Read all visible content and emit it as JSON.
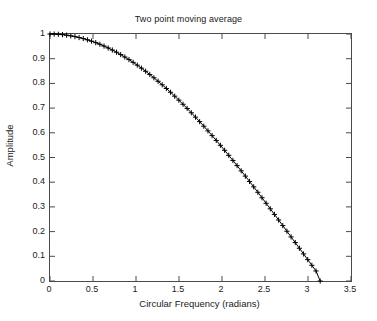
{
  "chart_data": {
    "type": "line",
    "title": "Two point moving average",
    "xlabel": "Circular Frequency  (radians)",
    "ylabel": "Amplitude",
    "xlim": [
      0,
      3.5
    ],
    "ylim": [
      0,
      1
    ],
    "grid": false,
    "legend": null,
    "marker": "plus",
    "line_color": "#000000",
    "marker_color": "#000000",
    "frame_color": "#4a4a4a",
    "background": "#ffffff",
    "xticks": [
      0,
      0.5,
      1,
      1.5,
      2,
      2.5,
      3,
      3.5
    ],
    "xtick_labels": [
      "0",
      "0.5",
      "1",
      "1.5",
      "2",
      "2.5",
      "3",
      "3.5"
    ],
    "yticks": [
      0,
      0.1,
      0.2,
      0.3,
      0.4,
      0.5,
      0.6,
      0.7,
      0.8,
      0.9,
      1
    ],
    "ytick_labels": [
      "0",
      "0.1",
      "0.2",
      "0.3",
      "0.4",
      "0.5",
      "0.6",
      "0.7",
      "0.8",
      "0.9",
      "1"
    ],
    "series": [
      {
        "name": "Two point moving average magnitude response",
        "formula": "|cos(w/2)|",
        "x": [
          0,
          0.0483,
          0.0967,
          0.145,
          0.1933,
          0.2417,
          0.29,
          0.3383,
          0.3867,
          0.435,
          0.4833,
          0.5317,
          0.58,
          0.6283,
          0.6767,
          0.725,
          0.7733,
          0.8217,
          0.87,
          0.9183,
          0.9667,
          1.015,
          1.0633,
          1.1117,
          1.16,
          1.2083,
          1.2567,
          1.305,
          1.3533,
          1.4017,
          1.45,
          1.4983,
          1.5467,
          1.595,
          1.6433,
          1.6917,
          1.74,
          1.7883,
          1.8367,
          1.885,
          1.9333,
          1.9817,
          2.03,
          2.0783,
          2.1267,
          2.175,
          2.2233,
          2.2717,
          2.32,
          2.3683,
          2.4167,
          2.465,
          2.5133,
          2.5617,
          2.61,
          2.6583,
          2.7067,
          2.755,
          2.8033,
          2.8517,
          2.9,
          2.9483,
          2.9967,
          3.045,
          3.0933,
          3.1416
        ],
        "y": [
          1.0,
          0.9997,
          0.9988,
          0.9974,
          0.9953,
          0.9927,
          0.9895,
          0.9857,
          0.9814,
          0.9765,
          0.971,
          0.965,
          0.9584,
          0.9511,
          0.9434,
          0.935,
          0.9262,
          0.9167,
          0.9068,
          0.8963,
          0.8853,
          0.8738,
          0.8617,
          0.8492,
          0.8362,
          0.8227,
          0.8087,
          0.7943,
          0.7794,
          0.7641,
          0.7483,
          0.7321,
          0.7155,
          0.6985,
          0.6811,
          0.6633,
          0.6452,
          0.6267,
          0.6078,
          0.5886,
          0.5691,
          0.5493,
          0.5292,
          0.5088,
          0.4881,
          0.4672,
          0.446,
          0.4246,
          0.403,
          0.3812,
          0.3592,
          0.337,
          0.3147,
          0.2923,
          0.2697,
          0.247,
          0.2243,
          0.2014,
          0.1785,
          0.1556,
          0.1326,
          0.1096,
          0.0866,
          0.0636,
          0.0406,
          0.0
        ]
      }
    ]
  }
}
